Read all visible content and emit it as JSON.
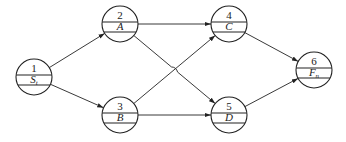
{
  "diagram": {
    "type": "activity-on-node network",
    "nodes": [
      {
        "id": "1",
        "number": "1",
        "label": "S",
        "subscript": "t",
        "cx": 34,
        "cy": 77
      },
      {
        "id": "2",
        "number": "2",
        "label": "A",
        "subscript": "",
        "cx": 120,
        "cy": 24
      },
      {
        "id": "3",
        "number": "3",
        "label": "B",
        "subscript": "",
        "cx": 120,
        "cy": 115
      },
      {
        "id": "4",
        "number": "4",
        "label": "C",
        "subscript": "",
        "cx": 229,
        "cy": 24
      },
      {
        "id": "5",
        "number": "5",
        "label": "D",
        "subscript": "",
        "cx": 229,
        "cy": 115
      },
      {
        "id": "6",
        "number": "6",
        "label": "F",
        "subscript": "n",
        "cx": 314,
        "cy": 70
      }
    ],
    "edges": [
      {
        "from": "1",
        "to": "2"
      },
      {
        "from": "1",
        "to": "3"
      },
      {
        "from": "2",
        "to": "4"
      },
      {
        "from": "2",
        "to": "5"
      },
      {
        "from": "3",
        "to": "4"
      },
      {
        "from": "3",
        "to": "5"
      },
      {
        "from": "4",
        "to": "6"
      },
      {
        "from": "5",
        "to": "6"
      }
    ],
    "colors": {
      "stroke": "#222222",
      "background": "#ffffff"
    }
  }
}
